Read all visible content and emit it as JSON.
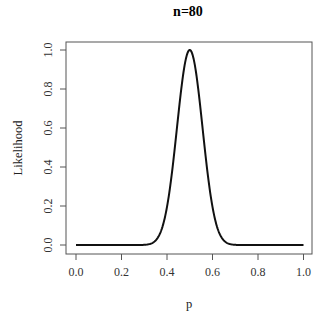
{
  "chart_data": {
    "type": "line",
    "title": "n=80",
    "xlabel": "p",
    "ylabel": "Likelihood",
    "xlim": [
      0,
      1
    ],
    "ylim": [
      0,
      1
    ],
    "x_ticks": [
      "0.0",
      "0.2",
      "0.4",
      "0.6",
      "0.8",
      "1.0"
    ],
    "y_ticks": [
      "0.0",
      "0.2",
      "0.4",
      "0.6",
      "0.8",
      "1.0"
    ],
    "grid": false,
    "legend": null,
    "series": [
      {
        "name": "normalized binomial likelihood (n=80, k=40)",
        "color": "#111111",
        "x": [
          0.0,
          0.1,
          0.2,
          0.3,
          0.33,
          0.35,
          0.37,
          0.38,
          0.4,
          0.42,
          0.44,
          0.46,
          0.48,
          0.5,
          0.52,
          0.54,
          0.56,
          0.58,
          0.6,
          0.62,
          0.63,
          0.65,
          0.67,
          0.7,
          0.8,
          0.9,
          1.0
        ],
        "y": [
          0.0,
          0.0,
          0.0,
          0.001,
          0.008,
          0.023,
          0.057,
          0.093,
          0.195,
          0.354,
          0.56,
          0.774,
          0.938,
          1.0,
          0.938,
          0.774,
          0.56,
          0.354,
          0.195,
          0.093,
          0.057,
          0.023,
          0.008,
          0.001,
          0.0,
          0.0,
          0.0
        ]
      }
    ]
  }
}
